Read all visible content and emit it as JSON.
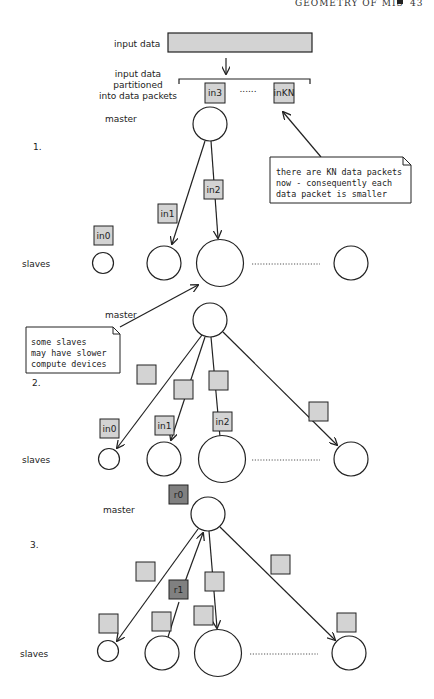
{
  "header": {
    "running_title": "GEOMETRY OF MIS",
    "page_number": "43"
  },
  "top": {
    "input_label": "input data",
    "partition_label": [
      "input data",
      "partitioned",
      "into data packets"
    ],
    "packets": [
      "in3",
      "inKN"
    ],
    "ellipsis": "......"
  },
  "stage1": {
    "number": "1.",
    "master_label": "master",
    "slaves_label": "slaves",
    "packets": [
      "in0",
      "in1",
      "in2"
    ],
    "callout": [
      "there are KN data packets",
      "now - consequently each",
      "data packet is smaller"
    ]
  },
  "stage2": {
    "number": "2.",
    "master_label": "master",
    "slaves_label": "slaves",
    "packets": [
      "in0",
      "in1",
      "in2"
    ],
    "callout": [
      "some slaves",
      "may have slower",
      "compute devices"
    ]
  },
  "stage3": {
    "number": "3.",
    "master_label": "master",
    "slaves_label": "slaves",
    "results": [
      "r0",
      "r1"
    ]
  },
  "colors": {
    "packet": "#d3d3d3",
    "result": "#808080",
    "stroke": "#222222"
  }
}
